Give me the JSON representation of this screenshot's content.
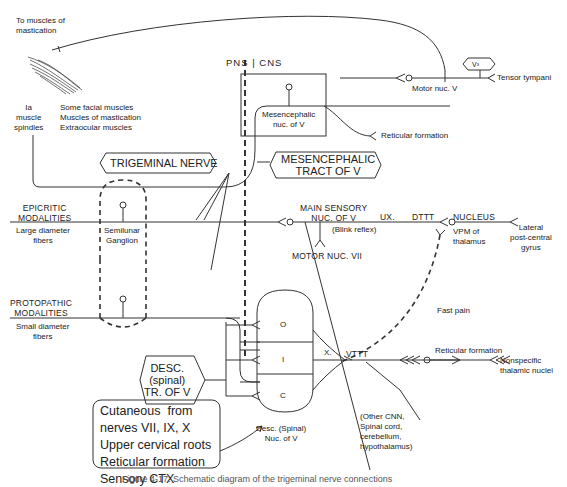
{
  "labels": {
    "to_muscles": "To muscles of\nmastication",
    "ia_spindles": "Ia\nmuscle\nspindles",
    "muscles_list": [
      "Some facial muscles",
      "Muscles of mastication",
      "Extraocular muscles"
    ],
    "pns_cns": "PNS | CNS",
    "mesencephalic_nuc": "Mesencephalic\nnuc. of V",
    "motor_nuc_v": "Motor nuc. V",
    "v3": "V³",
    "tensor_tympani": "Tensor tympani",
    "reticular_formation_top": "Reticular formation",
    "trigeminal_nerve": "TRIGEMINAL NERVE",
    "mesencephalic_tract": "MESENCEPHALIC\nTRACT OF V",
    "epicritic": "EPICRITIC\nMODALITIES",
    "large_fibers": "Large diameter\nfibers",
    "semilunar": "Semilunar\nGanglion",
    "main_sensory": "MAIN SENSORY\nNUC. OF V",
    "blink_reflex": "(Blink reflex)",
    "ux": "UX.",
    "dttt": "DTTT",
    "nucleus": "NUCLEUS",
    "vpm": "VPM of\nthalamus",
    "lateral_gyrus": "Lateral\npost-central\ngyrus",
    "motor_nuc_vii": "MOTOR NUC. VII",
    "protopathic": "PROTOPATHIC\nMODALITIES",
    "small_fibers": "Small diameter\nfibers",
    "fast_pain": "Fast pain",
    "o": "O",
    "i": "I",
    "c": "C",
    "x": "X.",
    "vttt": "VTTT",
    "reticular_formation_right": "Reticular formation",
    "nonspecific": "Nonspecific\nthalamic nuclei",
    "desc_tract": "DESC.\n(spinal)\nTR. OF V",
    "inputs_box": [
      "Cutaneous  from",
      "nerves VII, IX, X",
      "Upper cervical roots",
      "Reticular formation",
      "Sensory CTX"
    ],
    "desc_nuc": "Desc. (Spinal)\nNuc. of V",
    "other_cnn": "(Other CNN,\nSpinal cord,\ncerebellum,\nhypothalamus)",
    "caption": "Figure 4-17. Schematic diagram of the trigeminal nerve connections"
  }
}
